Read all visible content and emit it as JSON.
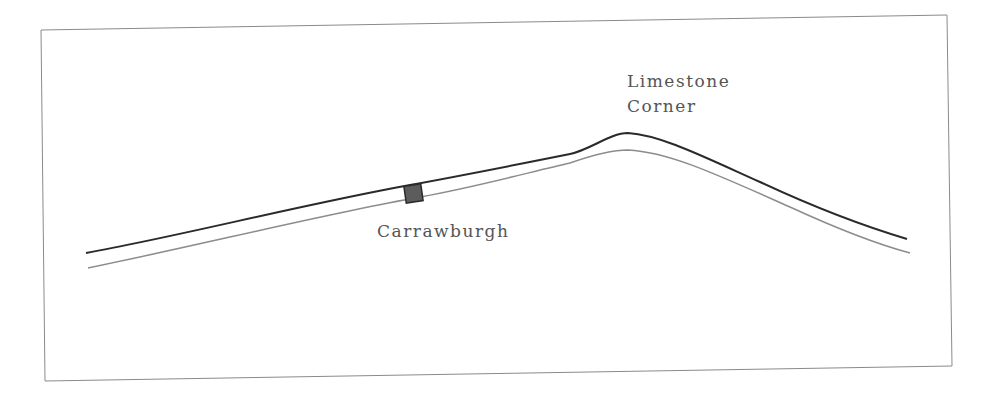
{
  "map": {
    "colors": {
      "background": "#ffffff",
      "frame": "#8a8a8a",
      "wall_line": "#2a2a2a",
      "vallum_line": "#8c8c8c",
      "fort_fill": "#5c5c5c",
      "fort_stroke": "#2a2a2a",
      "label": "#555555"
    },
    "features": [
      {
        "id": "wall",
        "type": "line",
        "style": "dark"
      },
      {
        "id": "vallum",
        "type": "line",
        "style": "grey"
      }
    ],
    "places": [
      {
        "id": "carrawburgh",
        "name": "Carrawburgh",
        "marker": "square"
      },
      {
        "id": "limestone-corner",
        "name_lines": [
          "Limestone",
          "Corner"
        ],
        "marker": "none"
      }
    ]
  }
}
